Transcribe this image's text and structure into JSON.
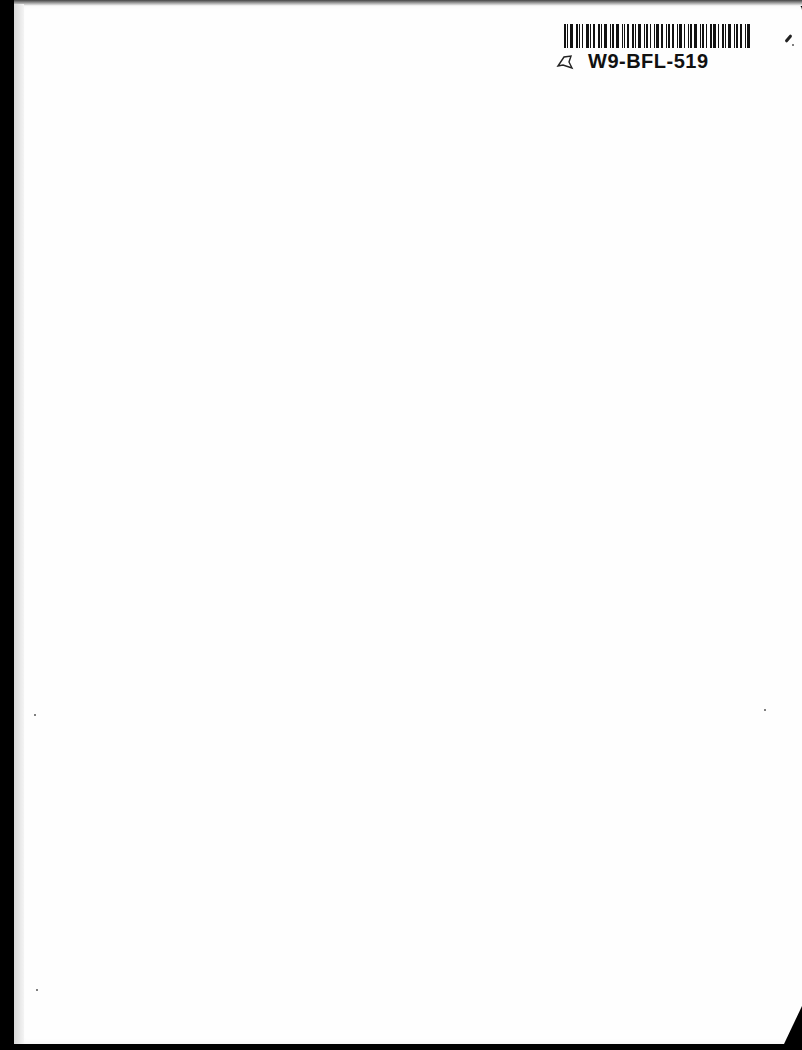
{
  "document": {
    "type": "scanned blank page",
    "label": {
      "code": "W9-BFL-519",
      "barcode_icon": "barcode-icon",
      "flag_icon": "flag-icon"
    }
  },
  "colors": {
    "page": "#fefefe",
    "background": "#000000",
    "ink": "#111111"
  }
}
